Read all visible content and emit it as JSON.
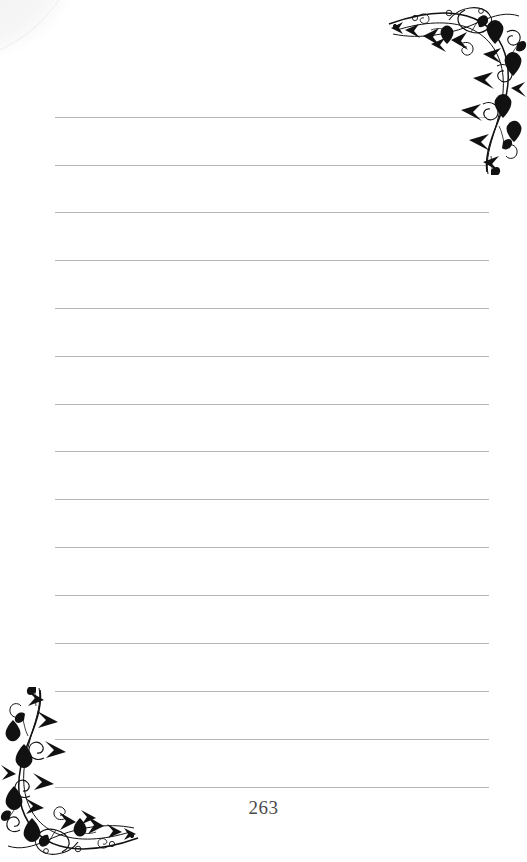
{
  "page": {
    "type": "ruled-journal-page",
    "width": 527,
    "height": 862,
    "background_color": "#ffffff",
    "page_number": "263",
    "page_number_color": "#4a4a4a"
  },
  "rules": {
    "label": "ruled-writing-lines",
    "color": "#b4b4b4",
    "count": 15,
    "left_x": 55,
    "right_x": 490,
    "first_y": 117,
    "spacing": 48,
    "lines": [
      {
        "y": 117,
        "x1": 55,
        "x2": 487
      },
      {
        "y": 165,
        "x1": 55,
        "x2": 487
      },
      {
        "y": 212,
        "x1": 55,
        "x2": 489
      },
      {
        "y": 260,
        "x1": 55,
        "x2": 489
      },
      {
        "y": 308,
        "x1": 55,
        "x2": 489
      },
      {
        "y": 356,
        "x1": 55,
        "x2": 489
      },
      {
        "y": 404,
        "x1": 55,
        "x2": 489
      },
      {
        "y": 451,
        "x1": 55,
        "x2": 489
      },
      {
        "y": 499,
        "x1": 55,
        "x2": 489
      },
      {
        "y": 547,
        "x1": 55,
        "x2": 489
      },
      {
        "y": 595,
        "x1": 55,
        "x2": 489
      },
      {
        "y": 643,
        "x1": 55,
        "x2": 489
      },
      {
        "y": 691,
        "x1": 55,
        "x2": 489
      },
      {
        "y": 739,
        "x1": 55,
        "x2": 489
      },
      {
        "y": 787,
        "x1": 55,
        "x2": 489
      }
    ]
  },
  "ornaments": {
    "color": "#111111",
    "top_right": {
      "name": "floral-vine-corner-ornament",
      "position": "top-right",
      "motifs": [
        "swirling-vine",
        "spiral-curls",
        "arrow-leaves",
        "tulip-flowers",
        "small-buds"
      ]
    },
    "bottom_left": {
      "name": "floral-vine-corner-ornament",
      "position": "bottom-left",
      "motifs": [
        "swirling-vine",
        "spiral-curls",
        "arrow-leaves",
        "tulip-flowers",
        "small-buds"
      ]
    }
  },
  "artifacts": {
    "scan_smudge": {
      "name": "scan-edge-smudge",
      "position": "top-left",
      "color": "#f2f2f3"
    }
  }
}
